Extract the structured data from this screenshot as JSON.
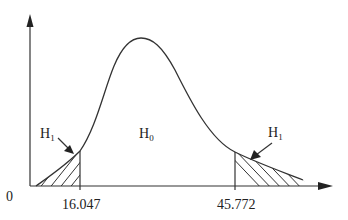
{
  "diagram": {
    "type": "two-tailed hypothesis test on a right-skewed (chi-square-like) distribution",
    "origin_label": "0",
    "null_region_label": "H",
    "null_region_subscript": "0",
    "alt_left_label": "H",
    "alt_left_subscript": "1",
    "alt_right_label": "H",
    "alt_right_subscript": "1",
    "lower_critical_value": "16.047",
    "upper_critical_value": "45.772",
    "colors": {
      "line": "#333333",
      "background": "#ffffff"
    }
  }
}
